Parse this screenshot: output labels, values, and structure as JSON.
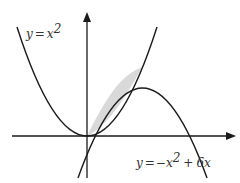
{
  "diagram": {
    "title": "",
    "curves": [
      {
        "id": "parabola-up",
        "equation": "y = x^2",
        "label_parts": {
          "lhs": "y",
          "eq": "=",
          "var": "x",
          "exp": "2"
        }
      },
      {
        "id": "parabola-down",
        "equation": "y = -x^2 + 6x",
        "label_parts": {
          "lhs": "y",
          "eq": "=",
          "neg": "−",
          "var": "x",
          "exp": "2",
          "plus": "+",
          "coef": "6",
          "var2": "x"
        }
      }
    ],
    "shaded_region": {
      "between": [
        "y = x^2",
        "y = -x^2 + 6x"
      ],
      "x_range": [
        0,
        3
      ],
      "fill": "#d9d9d9"
    },
    "intersections": [
      [
        0,
        0
      ],
      [
        3,
        9
      ]
    ],
    "axes": {
      "x_axis": true,
      "y_axis": true,
      "arrows": true
    },
    "colors": {
      "curve": "#1a1a1a",
      "shade": "#d9d9d9",
      "background": "#ffffff"
    }
  }
}
